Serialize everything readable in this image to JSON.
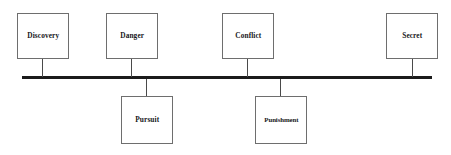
{
  "diagram": {
    "type": "fishbone-timeline",
    "spine": {
      "name": "horizontal-spine",
      "x": 22,
      "y": 76,
      "width": 410,
      "height": 3,
      "color": "#1b1b1b"
    },
    "nodes": [
      {
        "id": "discovery",
        "label": "Discovery",
        "side": "above",
        "box": {
          "x": 17,
          "y": 13,
          "width": 52,
          "height": 46
        },
        "connector": {
          "x": 42,
          "y": 59,
          "length": 18
        },
        "fit": "normal"
      },
      {
        "id": "danger",
        "label": "Danger",
        "side": "above",
        "box": {
          "x": 106,
          "y": 13,
          "width": 52,
          "height": 46
        },
        "connector": {
          "x": 131,
          "y": 59,
          "length": 18
        },
        "fit": "normal"
      },
      {
        "id": "pursuit",
        "label": "Pursuit",
        "side": "below",
        "box": {
          "x": 121,
          "y": 96,
          "width": 52,
          "height": 48
        },
        "connector": {
          "x": 146,
          "y": 79,
          "length": 17
        },
        "fit": "normal"
      },
      {
        "id": "conflict",
        "label": "Conflict",
        "side": "above",
        "box": {
          "x": 222,
          "y": 13,
          "width": 52,
          "height": 46
        },
        "connector": {
          "x": 247,
          "y": 59,
          "length": 18
        },
        "fit": "normal"
      },
      {
        "id": "punishment",
        "label": "Punishment",
        "side": "below",
        "box": {
          "x": 255,
          "y": 96,
          "width": 52,
          "height": 48
        },
        "connector": {
          "x": 280,
          "y": 79,
          "length": 17
        },
        "fit": "narrow"
      },
      {
        "id": "secret",
        "label": "Secret",
        "side": "above",
        "box": {
          "x": 386,
          "y": 13,
          "width": 52,
          "height": 46
        },
        "connector": {
          "x": 412,
          "y": 59,
          "length": 18
        },
        "fit": "normal"
      }
    ],
    "colors": {
      "spine": "#1b1b1b",
      "box_border": "#6e6e6e",
      "connector": "#4a4a4a",
      "text": "#17171a",
      "background": "#ffffff"
    }
  }
}
